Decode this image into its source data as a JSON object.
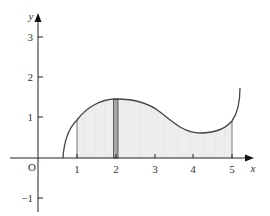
{
  "diagram": {
    "title": "",
    "axes": {
      "x_label": "x",
      "y_label": "y",
      "origin_label": "O",
      "x_ticks": [
        "1",
        "2",
        "3",
        "4",
        "5"
      ],
      "y_ticks": [
        "3",
        "2",
        "1",
        "−1"
      ]
    },
    "curve": {
      "start": [
        0.65,
        0
      ],
      "local_max": [
        2.0,
        1.45
      ],
      "local_min": [
        4.3,
        0.6
      ],
      "end": [
        5.2,
        1.7
      ],
      "sample_points": [
        [
          0.65,
          0
        ],
        [
          1,
          0.95
        ],
        [
          2,
          1.45
        ],
        [
          3,
          1.15
        ],
        [
          4.3,
          0.6
        ],
        [
          5,
          0.95
        ],
        [
          5.2,
          1.7
        ]
      ]
    },
    "shaded_region": {
      "x_from": 1,
      "x_to": 5,
      "fill": "#ededed"
    },
    "strip": {
      "x_center": 2,
      "width_units": 0.1,
      "fill": "#a6a6a6",
      "stroke": "#555555"
    },
    "colors": {
      "axis": "#222222",
      "curve": "#444444",
      "text": "#333333"
    }
  }
}
